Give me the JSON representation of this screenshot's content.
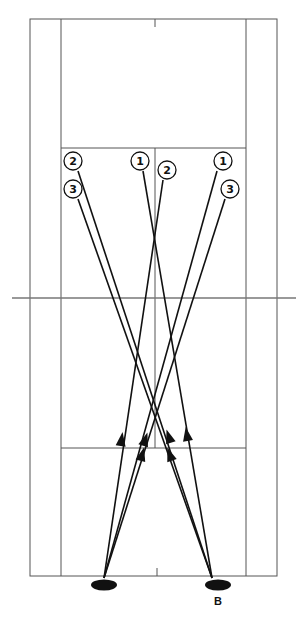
{
  "diagram": {
    "type": "badminton-court-shot-diagram",
    "court": {
      "outer_left_x": 30,
      "inner_left_x": 61,
      "center_x": 155,
      "inner_right_x": 246,
      "outer_right_x": 277,
      "top_y": 19,
      "top_service_y": 148,
      "net_y": 298,
      "bottom_service_y": 448,
      "bottom_y": 576
    },
    "target_positions": [
      {
        "label": "2",
        "x": 73,
        "y": 161
      },
      {
        "label": "3",
        "x": 73,
        "y": 189
      },
      {
        "label": "1",
        "x": 140,
        "y": 161
      },
      {
        "label": "2",
        "x": 167,
        "y": 170
      },
      {
        "label": "1",
        "x": 223,
        "y": 161
      },
      {
        "label": "3",
        "x": 230,
        "y": 189
      }
    ],
    "players": [
      {
        "id": "left-player",
        "label": "",
        "x": 104,
        "y": 585
      },
      {
        "id": "right-player",
        "label": "B",
        "x": 218,
        "y": 585
      }
    ],
    "shots": [
      {
        "from": "left-player",
        "to_label": "2",
        "x1": 104,
        "y1": 578,
        "x2": 163,
        "y2": 180
      },
      {
        "from": "left-player",
        "to_label": "1",
        "x1": 104,
        "y1": 578,
        "x2": 217,
        "y2": 171
      },
      {
        "from": "left-player",
        "to_label": "3",
        "x1": 104,
        "y1": 578,
        "x2": 225,
        "y2": 199
      },
      {
        "from": "right-player",
        "to_label": "2",
        "x1": 212,
        "y1": 578,
        "x2": 78,
        "y2": 171
      },
      {
        "from": "right-player",
        "to_label": "3",
        "x1": 212,
        "y1": 578,
        "x2": 78,
        "y2": 199
      },
      {
        "from": "right-player",
        "to_label": "1",
        "x1": 212,
        "y1": 578,
        "x2": 143,
        "y2": 171
      }
    ],
    "colors": {
      "line": "#111111",
      "court": "#555555",
      "background": "#ffffff"
    }
  }
}
